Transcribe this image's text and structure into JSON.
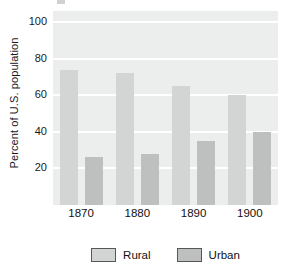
{
  "chart_data": {
    "type": "bar",
    "title": "",
    "xlabel": "",
    "ylabel": "Percent of U.S. population",
    "categories": [
      "1870",
      "1880",
      "1890",
      "1900"
    ],
    "series": [
      {
        "name": "Rural",
        "values": [
          74,
          72,
          65,
          60
        ],
        "color": "#d3d4d4"
      },
      {
        "name": "Urban",
        "values": [
          26,
          28,
          35,
          40
        ],
        "color": "#bebfbf"
      }
    ],
    "ylim": [
      0,
      106
    ],
    "yticks": [
      20,
      40,
      60,
      80,
      100
    ],
    "ytick_labels": [
      "20",
      "40",
      "60",
      "80",
      "100"
    ],
    "grid": true,
    "grid_color": "#ffffff",
    "plot_background": "#eceded",
    "legend_position": "bottom",
    "legend_entries": [
      "Rural",
      "Urban"
    ]
  },
  "axis": {
    "y_title": "Percent of U.S. population"
  },
  "legend": {
    "entries": [
      {
        "label": "Rural"
      },
      {
        "label": "Urban"
      }
    ]
  }
}
